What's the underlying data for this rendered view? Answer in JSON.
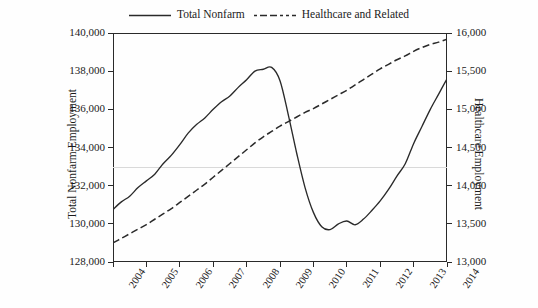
{
  "legend": {
    "items": [
      {
        "label": "Total Nonfarm",
        "style": "solid",
        "color": "#2a2a2a",
        "key_name": "legend-key-total-nonfarm"
      },
      {
        "label": "Healthcare and Related",
        "style": "dashed",
        "color": "#2a2a2a",
        "key_name": "legend-key-healthcare"
      }
    ]
  },
  "axes": {
    "left_title": "Total Nonfarm Employment",
    "right_title": "Healthcare Employment",
    "left_ticks": [
      "128,000",
      "130,000",
      "132,000",
      "134,000",
      "136,000",
      "138,000",
      "140,000"
    ],
    "right_ticks": [
      "13,000",
      "13,500",
      "14,000",
      "14,500",
      "15,000",
      "15,500",
      "16,000"
    ],
    "x_ticks": [
      "2004",
      "2005",
      "2006",
      "2007",
      "2008",
      "2009",
      "2010",
      "2011",
      "2012",
      "2013",
      "2014"
    ]
  },
  "chart_data": {
    "type": "line",
    "title": "",
    "xlabel": "",
    "ylabel": "Total Nonfarm Employment",
    "y2label": "Healthcare Employment",
    "xlim": [
      2004,
      2014
    ],
    "ylim": [
      128000,
      140000
    ],
    "y2lim": [
      13000,
      16000
    ],
    "grid": true,
    "legend_position": "top-center",
    "x_tick_values": [
      2004,
      2005,
      2006,
      2007,
      2008,
      2009,
      2010,
      2011,
      2012,
      2013,
      2014
    ],
    "y_tick_values": [
      128000,
      130000,
      132000,
      134000,
      136000,
      138000,
      140000
    ],
    "y2_tick_values": [
      13000,
      13500,
      14000,
      14500,
      15000,
      15500,
      16000
    ],
    "series": [
      {
        "name": "Total Nonfarm",
        "axis": "left",
        "style": "solid",
        "color": "#2a2a2a",
        "units": "thousands of jobs",
        "x": [
          2004.0,
          2004.25,
          2004.5,
          2004.75,
          2005.0,
          2005.25,
          2005.5,
          2005.75,
          2006.0,
          2006.25,
          2006.5,
          2006.75,
          2007.0,
          2007.25,
          2007.5,
          2007.75,
          2008.0,
          2008.25,
          2008.5,
          2008.75,
          2009.0,
          2009.25,
          2009.5,
          2009.75,
          2010.0,
          2010.25,
          2010.5,
          2010.75,
          2011.0,
          2011.25,
          2011.5,
          2011.75,
          2012.0,
          2012.25,
          2012.5,
          2012.75,
          2013.0,
          2013.25,
          2013.5,
          2013.75,
          2014.0
        ],
        "y": [
          130750,
          131150,
          131450,
          131900,
          132250,
          132600,
          133150,
          133600,
          134150,
          134750,
          135200,
          135550,
          136000,
          136400,
          136700,
          137150,
          137550,
          138000,
          138100,
          138200,
          137500,
          135700,
          133700,
          131900,
          130600,
          129850,
          129700,
          130000,
          130150,
          129950,
          130250,
          130700,
          131200,
          131800,
          132500,
          133150,
          134200,
          135100,
          136000,
          136800,
          137600
        ]
      },
      {
        "name": "Healthcare and Related",
        "axis": "right",
        "style": "dashed",
        "color": "#2a2a2a",
        "units": "thousands of jobs",
        "x": [
          2004.0,
          2004.25,
          2004.5,
          2004.75,
          2005.0,
          2005.25,
          2005.5,
          2005.75,
          2006.0,
          2006.25,
          2006.5,
          2006.75,
          2007.0,
          2007.25,
          2007.5,
          2007.75,
          2008.0,
          2008.25,
          2008.5,
          2008.75,
          2009.0,
          2009.25,
          2009.5,
          2009.75,
          2010.0,
          2010.25,
          2010.5,
          2010.75,
          2011.0,
          2011.25,
          2011.5,
          2011.75,
          2012.0,
          2012.25,
          2012.5,
          2012.75,
          2013.0,
          2013.25,
          2013.5,
          2013.75,
          2014.0
        ],
        "y": [
          13250,
          13310,
          13370,
          13430,
          13490,
          13560,
          13630,
          13700,
          13780,
          13860,
          13940,
          14020,
          14110,
          14200,
          14290,
          14380,
          14470,
          14560,
          14640,
          14710,
          14780,
          14840,
          14900,
          14960,
          15010,
          15070,
          15130,
          15190,
          15250,
          15320,
          15390,
          15460,
          15530,
          15590,
          15650,
          15700,
          15760,
          15810,
          15850,
          15880,
          15920
        ]
      }
    ]
  }
}
